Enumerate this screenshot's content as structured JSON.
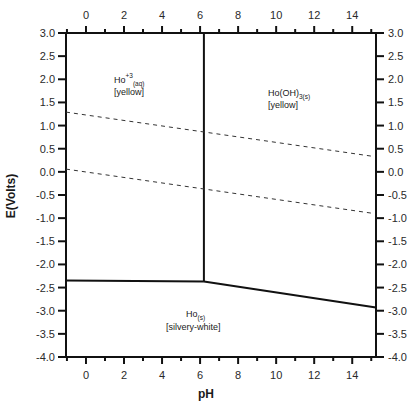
{
  "chart_data": {
    "type": "line",
    "title": "",
    "xlabel": "pH",
    "ylabel": "E(Volts)",
    "xlim": [
      -1.05,
      15.25
    ],
    "ylim": [
      -4.0,
      3.0
    ],
    "grid": false,
    "legend": null,
    "x_ticks_major": [
      0,
      2,
      4,
      6,
      8,
      10,
      12,
      14
    ],
    "x_ticks_minor": [
      -1,
      1,
      3,
      5,
      7,
      9,
      11,
      13,
      15
    ],
    "y_ticks": [
      3.0,
      2.5,
      2.0,
      1.5,
      1.0,
      0.5,
      0.0,
      -0.5,
      -1.0,
      -1.5,
      -2.0,
      -2.5,
      -3.0,
      -3.5,
      -4.0
    ],
    "y_tick_labels": [
      "3.0",
      "2.5",
      "2.0",
      "1.5",
      "1.0",
      "0.5",
      "0.0",
      "-0.5",
      "-1.0",
      "-1.5",
      "-2.0",
      "-2.5",
      "-3.0",
      "-3.5",
      "-4.0"
    ],
    "x_tick_labels": [
      "0",
      "2",
      "4",
      "6",
      "8",
      "10",
      "12",
      "14"
    ],
    "axes_mirrored": true,
    "series": [
      {
        "name": "Ho3+/Ho(OH)3 boundary",
        "style": "solid",
        "x": [
          6.2,
          6.2
        ],
        "y": [
          3.0,
          -2.37
        ]
      },
      {
        "name": "Ho3+/Ho boundary",
        "style": "solid",
        "x": [
          -1.05,
          6.2
        ],
        "y": [
          -2.35,
          -2.37
        ]
      },
      {
        "name": "Ho(OH)3/Ho boundary",
        "style": "solid",
        "x": [
          6.2,
          15.25
        ],
        "y": [
          -2.37,
          -2.93
        ]
      },
      {
        "name": "O2/H2O (water upper limit)",
        "style": "dashed",
        "x": [
          -1.05,
          15.0
        ],
        "y": [
          1.29,
          0.34
        ]
      },
      {
        "name": "H2O/H2 (water lower limit)",
        "style": "dashed",
        "x": [
          -1.05,
          15.0
        ],
        "y": [
          0.06,
          -0.89
        ]
      }
    ],
    "regions": [
      {
        "species": "Ho",
        "superscript": "+3",
        "subscript": "(aq)",
        "note": "[yellow]",
        "x": 1.5,
        "y": 2.1
      },
      {
        "species": "Ho(OH)",
        "superscript": "",
        "subscript": "3(s)",
        "note": "[yellow]",
        "x": 10.2,
        "y": 1.8
      },
      {
        "species": "Ho",
        "superscript": "",
        "subscript": "(s)",
        "note": "[silvery-white]",
        "x": 7.5,
        "y": -3.1
      }
    ]
  },
  "labels": {
    "xlabel": "pH",
    "ylabel": "E(Volts)",
    "region1_main": "Ho",
    "region1_sup": "+3",
    "region1_sub": "(aq)",
    "region1_note": "[yellow]",
    "region2_main": "Ho(OH)",
    "region2_sub": "3(s)",
    "region2_note": "[yellow]",
    "region3_main": "Ho",
    "region3_sub": "(s)",
    "region3_note": "[silvery-white]"
  }
}
